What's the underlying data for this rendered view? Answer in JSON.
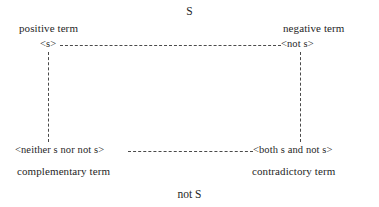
{
  "diagram": {
    "title_top": "S",
    "title_bottom": "not S",
    "corners": {
      "top_left": {
        "term_label": "positive term",
        "node_label": "<s>"
      },
      "top_right": {
        "term_label": "negative term",
        "node_label": "<not s>"
      },
      "bottom_left": {
        "term_label": "complementary term",
        "node_label": "<neither s nor not s>"
      },
      "bottom_right": {
        "term_label": "contradictory term",
        "node_label": "<both s and not s>"
      }
    },
    "connectors": [
      {
        "name": "top-horizontal-connector",
        "style": "dashed"
      },
      {
        "name": "bottom-horizontal-connector",
        "style": "dashed"
      },
      {
        "name": "left-vertical-connector",
        "style": "dashed"
      },
      {
        "name": "right-vertical-connector",
        "style": "dashed"
      }
    ],
    "colors": {
      "background": "#ffffff",
      "text": "#262626",
      "line": "#4a4a4a"
    }
  }
}
